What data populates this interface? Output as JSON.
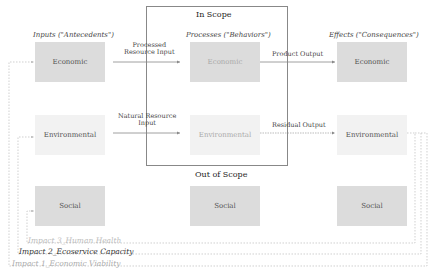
{
  "scope": {
    "in_label": "In Scope",
    "out_label": "Out of Scope"
  },
  "columns": {
    "inputs": "Inputs (\"Antecedents\")",
    "processes": "Processes (\"Behaviors\")",
    "effects": "Effects (\"Consequences\")"
  },
  "nodes": {
    "inputs": [
      "Economic",
      "Environmental",
      "Social"
    ],
    "processes": [
      "Economic",
      "Environmental",
      "Social"
    ],
    "effects": [
      "Economic",
      "Environmental",
      "Social"
    ]
  },
  "flows": {
    "processed_input_line1": "Processed",
    "processed_input_line2": "Resource Input",
    "natural_input_line1": "Natural Resource",
    "natural_input_line2": "Input",
    "product_output": "Product Output",
    "residual_output": "Residual Output"
  },
  "impacts": [
    {
      "label": "Impact 3_Human Health",
      "color": "#bbbbbb"
    },
    {
      "label": "Impact 2_Ecoservice Capacity",
      "color": "#333333"
    },
    {
      "label": "Impact 1_Economic Viability",
      "color": "#aaaaaa"
    }
  ],
  "colors": {
    "box_dark": "#dcdcdc",
    "box_light": "#f2f2f2",
    "line": "#888888",
    "dashed": "#bbbbbb"
  }
}
